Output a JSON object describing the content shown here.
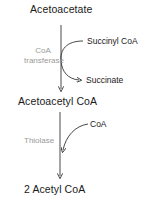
{
  "diagram": {
    "type": "metabolic-pathway",
    "nodes": {
      "acetoacetate": "Acetoacetate",
      "acetoacetyl_coa": "Acetoacetyl CoA",
      "acetyl_coa": "2 Acetyl CoA"
    },
    "step1": {
      "enzyme_line1": "CoA",
      "enzyme_line2": "transferase",
      "input": "Succinyl CoA",
      "output": "Succinate"
    },
    "step2": {
      "enzyme": "Thiolase",
      "input": "CoA"
    },
    "colors": {
      "text": "#1a1a1a",
      "enzyme_text": "#9a9a9a",
      "arrow": "#333333"
    }
  }
}
